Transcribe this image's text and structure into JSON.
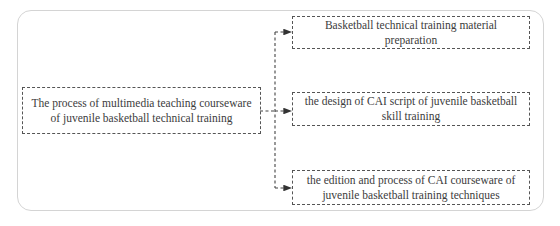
{
  "diagram": {
    "type": "flowchart",
    "source_node": {
      "id": "root",
      "label": "The process of multimedia teaching courseware of juvenile basketball technical training"
    },
    "target_nodes": [
      {
        "id": "step1",
        "label": "Basketball technical training material preparation"
      },
      {
        "id": "step2",
        "label": "the design of CAI script of juvenile basketball skill training"
      },
      {
        "id": "step3",
        "label": "the edition and process of CAI courseware of juvenile basketball training techniques"
      }
    ],
    "edges": [
      {
        "from": "root",
        "to": "step1"
      },
      {
        "from": "root",
        "to": "step2"
      },
      {
        "from": "root",
        "to": "step3"
      }
    ],
    "style": {
      "border_color": "#555555",
      "frame_color": "#d4d4d4",
      "line_style": "dashed"
    }
  }
}
